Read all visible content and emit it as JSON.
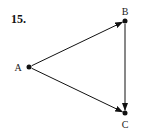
{
  "problem": {
    "number": "15."
  },
  "graph": {
    "type": "directed-graph",
    "nodes": [
      {
        "id": "A",
        "label": "A",
        "x": 29,
        "y": 67,
        "label_x": 18,
        "label_y": 67
      },
      {
        "id": "B",
        "label": "B",
        "x": 125,
        "y": 21,
        "label_x": 125,
        "label_y": 11
      },
      {
        "id": "C",
        "label": "C",
        "x": 125,
        "y": 113,
        "label_x": 125,
        "label_y": 124
      }
    ],
    "edges": [
      {
        "from": "A",
        "to": "B"
      },
      {
        "from": "A",
        "to": "C"
      },
      {
        "from": "B",
        "to": "C"
      }
    ],
    "color": "#111111"
  }
}
